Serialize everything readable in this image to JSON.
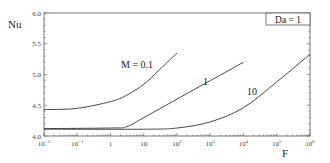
{
  "chart_data": {
    "type": "line",
    "title": "",
    "xlabel": "F",
    "ylabel": "Nu",
    "xscale": "log",
    "xlim": [
      0.01,
      1000000
    ],
    "ylim": [
      4.0,
      6.0
    ],
    "grid": false,
    "annotation": "Da = 1",
    "x_ticks": [
      "10^-2",
      "10^-1",
      "1",
      "10",
      "10^2",
      "10^3",
      "10^4",
      "10^5",
      "10^6"
    ],
    "y_ticks": [
      "4.0",
      "4.5",
      "5.0",
      "5.5",
      "6.0"
    ],
    "series": [
      {
        "name": "M = 0.1",
        "x": [
          0.01,
          0.1,
          1,
          3,
          10,
          30,
          100
        ],
        "y": [
          4.43,
          4.45,
          4.56,
          4.66,
          4.84,
          5.08,
          5.35
        ]
      },
      {
        "name": "1",
        "x": [
          0.01,
          1,
          3,
          10,
          100,
          1000,
          10000
        ],
        "y": [
          4.12,
          4.13,
          4.15,
          4.3,
          4.6,
          4.9,
          5.2
        ]
      },
      {
        "name": "10",
        "x": [
          0.01,
          10,
          100,
          1000,
          10000,
          100000,
          1000000
        ],
        "y": [
          4.11,
          4.11,
          4.13,
          4.23,
          4.46,
          4.88,
          5.33
        ]
      }
    ]
  },
  "labels": {
    "ylabel": "Nu",
    "xlabel": "F",
    "annotation": "Da = 1",
    "curve_m01": "M = 0.1",
    "curve_m1": "1",
    "curve_m10": "10"
  },
  "ticks": {
    "y": [
      "4.0",
      "4.5",
      "5.0",
      "5.5",
      "6.0"
    ]
  }
}
